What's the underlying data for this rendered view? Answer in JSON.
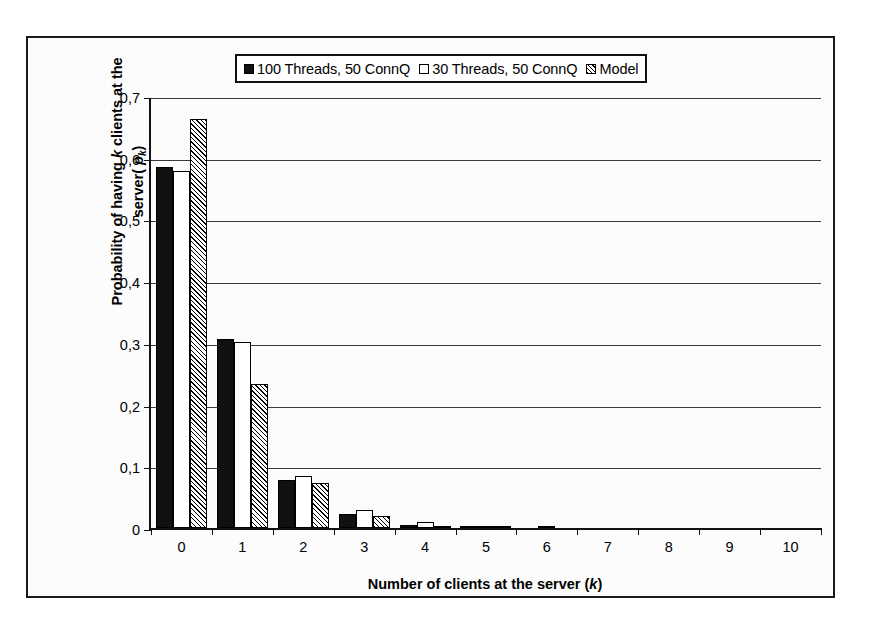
{
  "chart_data": {
    "type": "bar",
    "title": "",
    "xlabel": "Number of clients at the server (k)",
    "ylabel": "Probability of having  k clients at the server( pₖ)",
    "categories": [
      "0",
      "1",
      "2",
      "3",
      "4",
      "5",
      "6",
      "7",
      "8",
      "9",
      "10"
    ],
    "series": [
      {
        "name": "100 Threads, 50 ConnQ",
        "style": "solid-black",
        "values": [
          0.585,
          0.307,
          0.077,
          0.022,
          0.005,
          0.001,
          0.0,
          0.0,
          0.0,
          0.0,
          0.0
        ]
      },
      {
        "name": "30 Threads, 50 ConnQ",
        "style": "open-white",
        "values": [
          0.578,
          0.302,
          0.085,
          0.029,
          0.009,
          0.002,
          0.001,
          0.0,
          0.0,
          0.0,
          0.0
        ]
      },
      {
        "name": "Model",
        "style": "hatched",
        "values": [
          0.662,
          0.234,
          0.073,
          0.02,
          0.002,
          0.001,
          0.0,
          0.0,
          0.0,
          0.0,
          0.0
        ]
      }
    ],
    "ylim": [
      0,
      0.7
    ],
    "yticks": [
      0,
      0.1,
      0.2,
      0.3,
      0.4,
      0.5,
      0.6,
      0.7
    ],
    "ytick_labels": [
      "0",
      "0,1",
      "0,2",
      "0,3",
      "0,4",
      "0,5",
      "0,6",
      "0,7"
    ],
    "grid": true,
    "legend_position": "top-center",
    "decimal_separator": ","
  },
  "legend": {
    "entries": [
      {
        "label": "100 Threads, 50 ConnQ",
        "swatch": "sw-solid"
      },
      {
        "label": "30 Threads, 50 ConnQ",
        "swatch": "sw-open"
      },
      {
        "label": "Model",
        "swatch": "sw-hatch"
      }
    ]
  },
  "axis_titles": {
    "y_line1_pre": "Probability of having ",
    "y_line1_italic": "k",
    "y_line1_post": " clients at the",
    "y_line2_pre": "server( ",
    "y_line2_italic": "p",
    "y_line2_sub": "k",
    "y_line2_post": ")",
    "x_pre": "Number of clients at the server (",
    "x_italic": "k",
    "x_post": ")"
  },
  "colors": {
    "ink": "#111111",
    "series_solid": "#111111",
    "series_open": "#ffffff",
    "series_hatch": "#000000",
    "gridline": "#3a3a3a",
    "page_background": "#ffffff",
    "figure_background": "#fcfcfc"
  }
}
